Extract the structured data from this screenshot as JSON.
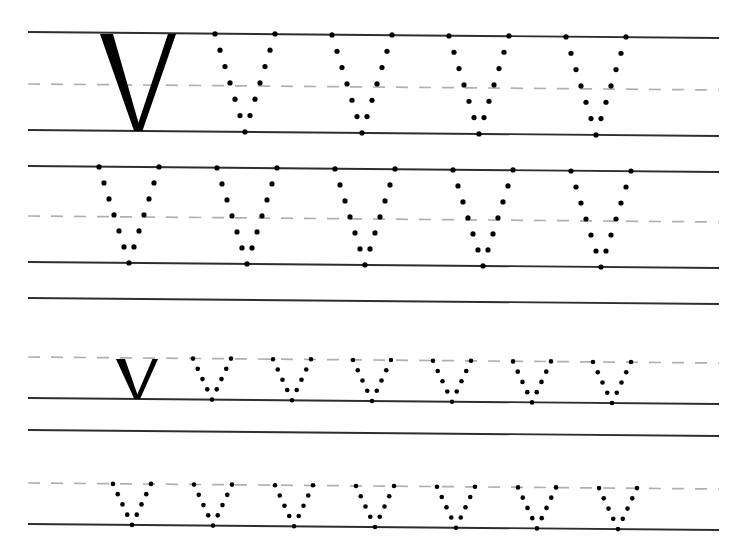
{
  "worksheet": {
    "title": "Letter V handwriting tracing practice worksheet",
    "letter_uppercase": "V",
    "letter_lowercase": "v",
    "background_color": "#ffffff",
    "ink_color": "#000000",
    "solid_rule_color": "#2e2e2e",
    "dashed_rule_color": "#b0b0b0",
    "page_width": 743,
    "page_height": 541,
    "rule_left_x": 28,
    "rule_right_x": 719,
    "baseline_tilt_px": 6,
    "rows": [
      {
        "name": "row-1-uppercase-model",
        "index": 1,
        "case": "uppercase",
        "top_y": 32,
        "mid_y": 84,
        "base_y": 130,
        "has_solid_model": true,
        "solid_model_x": 138,
        "solid_model_half_width": 38,
        "solid_model_stroke": 13,
        "dotted_count": 4,
        "dots_per_stroke": 6,
        "dotted_start_x": 245,
        "dotted_spacing": 117,
        "dotted_half_width": 30
      },
      {
        "name": "row-2-uppercase-practice",
        "index": 2,
        "case": "uppercase",
        "top_y": 166,
        "mid_y": 216,
        "base_y": 262,
        "has_solid_model": false,
        "dotted_count": 5,
        "dots_per_stroke": 6,
        "dotted_start_x": 129,
        "dotted_spacing": 118,
        "dotted_half_width": 30
      },
      {
        "name": "row-3-lowercase-model",
        "index": 3,
        "case": "lowercase",
        "top_y": 298,
        "mid_y": 357,
        "base_y": 398,
        "has_solid_model": true,
        "solid_model_x": 137,
        "solid_model_half_width": 21,
        "solid_model_stroke": 9,
        "dotted_count": 6,
        "dots_per_stroke": 4,
        "dotted_start_x": 212,
        "dotted_spacing": 80,
        "dotted_half_width": 19
      },
      {
        "name": "row-4-lowercase-practice",
        "index": 4,
        "case": "lowercase",
        "top_y": 430,
        "mid_y": 483,
        "base_y": 524,
        "has_solid_model": false,
        "dotted_count": 7,
        "dots_per_stroke": 4,
        "dotted_start_x": 132,
        "dotted_spacing": 81,
        "dotted_half_width": 19
      }
    ]
  }
}
